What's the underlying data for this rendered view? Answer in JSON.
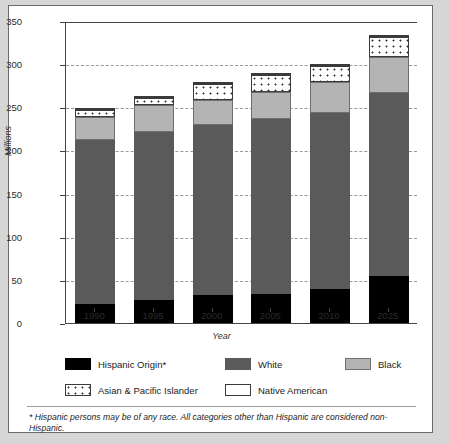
{
  "chart_data": {
    "type": "bar",
    "subtype": "stacked-bar",
    "title": "",
    "xlabel": "Year",
    "ylabel": "Millions",
    "ylim": [
      0,
      350
    ],
    "ytick_values": [
      0,
      50,
      100,
      150,
      200,
      250,
      300,
      350
    ],
    "ytick_labels": [
      "0",
      "50",
      "100",
      "150",
      "200",
      "250",
      "300",
      "350"
    ],
    "grid": "horizontal-dashed",
    "legend_position": "below-axes",
    "categories": [
      "1990",
      "1995",
      "2000",
      "2005",
      "2010",
      "2025"
    ],
    "series": [
      {
        "name": "Hispanic Origin*",
        "color": "#000000",
        "values": [
          22,
          27,
          32,
          34,
          39,
          55
        ]
      },
      {
        "name": "White",
        "color": "#5a5a5a",
        "values": [
          190,
          194,
          197,
          203,
          204,
          212
        ]
      },
      {
        "name": "Black",
        "color": "#b4b4b4",
        "values": [
          27,
          32,
          29,
          31,
          36,
          41
        ]
      },
      {
        "name": "Asian & Pacific Islander",
        "color": "#ffffff-dotted",
        "values": [
          8,
          8,
          19,
          19,
          19,
          23
        ]
      },
      {
        "name": "Native American",
        "color": "#ffffff",
        "values": [
          2,
          2,
          2,
          2,
          2,
          3
        ]
      }
    ],
    "totals": [
      249,
      263,
      279,
      289,
      300,
      334
    ],
    "annotations": [
      "* Hispanic persons may be of any race. All categories other than Hispanic are considered non-Hispanic."
    ]
  },
  "axes": {
    "y_label": "Millions",
    "x_label": "Year",
    "y_ticks": [
      "350",
      "300",
      "250",
      "200",
      "150",
      "100",
      "50",
      "0"
    ],
    "x_ticks": [
      "1990",
      "1995",
      "2000",
      "2005",
      "2010",
      "2025"
    ]
  },
  "legend": {
    "items": [
      {
        "label": "Hispanic Origin*"
      },
      {
        "label": "White"
      },
      {
        "label": "Black"
      },
      {
        "label": "Asian & Pacific Islander"
      },
      {
        "label": "Native American"
      }
    ]
  },
  "footnote": {
    "text": "* Hispanic persons may be of any race. All categories other than Hispanic are considered non-Hispanic."
  }
}
